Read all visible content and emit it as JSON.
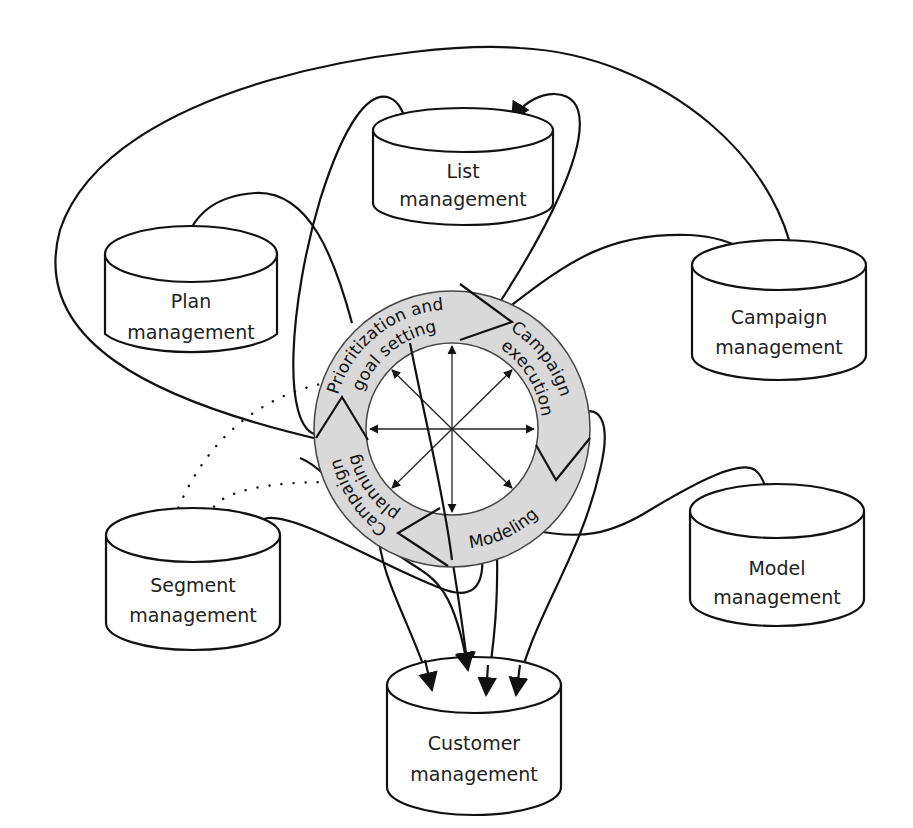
{
  "diagram": {
    "center": {
      "phases": [
        {
          "id": "prioritization",
          "label_line1": "Prioritization and",
          "label_line2": "goal setting"
        },
        {
          "id": "execution",
          "label_line1": "Campaign",
          "label_line2": "execution"
        },
        {
          "id": "modeling",
          "label_line1": "Modeling"
        },
        {
          "id": "planning",
          "label_line1": "Campaign",
          "label_line2": "planning"
        }
      ],
      "ring_fill": "#d9d9d9",
      "hub_arrows": 8
    },
    "databases": [
      {
        "id": "list",
        "line1": "List",
        "line2": "management"
      },
      {
        "id": "plan",
        "line1": "Plan",
        "line2": "management"
      },
      {
        "id": "campaign",
        "line1": "Campaign",
        "line2": "management"
      },
      {
        "id": "segment",
        "line1": "Segment",
        "line2": "management"
      },
      {
        "id": "model",
        "line1": "Model",
        "line2": "management"
      },
      {
        "id": "customer",
        "line1": "Customer",
        "line2": "management"
      }
    ],
    "colors": {
      "stroke": "#111111",
      "ring": "#d9d9d9",
      "background": "#ffffff"
    }
  }
}
